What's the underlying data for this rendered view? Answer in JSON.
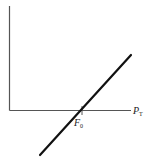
{
  "diagram": {
    "x_axis_label": {
      "main": "P",
      "sub": "T"
    },
    "intercept_label": {
      "main": "F",
      "sub": "0"
    },
    "colors": {
      "axis": "#555555",
      "line": "#111111",
      "text": "#1a1a1a"
    },
    "geometry": {
      "y_axis": {
        "x": 9.5,
        "y_top": 6,
        "y_bottom": 110.5
      },
      "x_axis": {
        "y": 110.5,
        "x_left": 9.5,
        "x_right": 131
      },
      "tick": {
        "x": 82,
        "y1": 106,
        "y2": 115
      },
      "line": {
        "x1": 40,
        "y1": 155,
        "x2": 131,
        "y2": 55
      }
    }
  }
}
